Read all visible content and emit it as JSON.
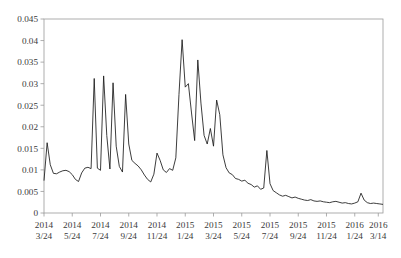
{
  "chart_data": {
    "type": "line",
    "title": "",
    "subtitle": "",
    "xlabel": "",
    "ylabel": "",
    "grid": false,
    "legend": false,
    "legend_position": "none",
    "ylim": [
      0,
      0.045
    ],
    "ytick_labels": [
      "0",
      "0.005",
      "0.01",
      "0.015",
      "0.02",
      "0.025",
      "0.03",
      "0.035",
      "0.04",
      "0.045"
    ],
    "ytick_values": [
      0,
      0.005,
      0.01,
      0.015,
      0.02,
      0.025,
      0.03,
      0.035,
      0.04,
      0.045
    ],
    "xtick_labels": [
      "2014\n3/24",
      "2014\n5/24",
      "2014\n7/24",
      "2014\n9/24",
      "2014\n11/24",
      "2015\n1/24",
      "2015\n3/24",
      "2015\n5/24",
      "2015\n7/24",
      "2015\n9/24",
      "2015\n11/24",
      "2016\n1/24",
      "2016\n3/14"
    ],
    "xtick_labels_top": [
      "2014",
      "2014",
      "2014",
      "2014",
      "2014",
      "2015",
      "2015",
      "2015",
      "2015",
      "2015",
      "2015",
      "2016",
      "2016"
    ],
    "xtick_labels_bottom": [
      "3/24",
      "5/24",
      "7/24",
      "9/24",
      "11/24",
      "1/24",
      "3/24",
      "5/24",
      "7/24",
      "9/24",
      "11/24",
      "1/24",
      "3/14"
    ],
    "xtick_positions": [
      0,
      0.0833,
      0.1667,
      0.25,
      0.3333,
      0.4167,
      0.5,
      0.5833,
      0.6667,
      0.75,
      0.8333,
      0.9167,
      0.9861
    ],
    "series": [
      {
        "name": "series-1",
        "color": "#1a1a1a",
        "values": [
          0.0075,
          0.0163,
          0.0112,
          0.0092,
          0.0091,
          0.0095,
          0.0098,
          0.0099,
          0.0096,
          0.0089,
          0.0078,
          0.0073,
          0.0093,
          0.0104,
          0.0106,
          0.0103,
          0.0312,
          0.0104,
          0.0099,
          0.0318,
          0.018,
          0.0102,
          0.0302,
          0.0155,
          0.0108,
          0.0095,
          0.0275,
          0.016,
          0.0122,
          0.0115,
          0.0109,
          0.01,
          0.0088,
          0.0078,
          0.0072,
          0.009,
          0.0139,
          0.0122,
          0.01,
          0.0094,
          0.0103,
          0.0099,
          0.0128,
          0.0275,
          0.0402,
          0.0292,
          0.03,
          0.0232,
          0.0168,
          0.0355,
          0.0255,
          0.018,
          0.016,
          0.0196,
          0.0155,
          0.0262,
          0.0228,
          0.0135,
          0.0105,
          0.0093,
          0.0089,
          0.008,
          0.0078,
          0.0074,
          0.0076,
          0.0069,
          0.0066,
          0.006,
          0.0063,
          0.0055,
          0.0058,
          0.0145,
          0.0068,
          0.0052,
          0.0047,
          0.0042,
          0.0039,
          0.0041,
          0.0038,
          0.0035,
          0.0037,
          0.0034,
          0.0032,
          0.003,
          0.0029,
          0.0031,
          0.0028,
          0.0027,
          0.0028,
          0.0026,
          0.0025,
          0.0024,
          0.0026,
          0.0027,
          0.0025,
          0.0023,
          0.0024,
          0.0022,
          0.0021,
          0.0023,
          0.0026,
          0.0046,
          0.003,
          0.0024,
          0.0022,
          0.0023,
          0.0022,
          0.0021,
          0.002
        ]
      }
    ]
  },
  "axes": {
    "plot_left": 44,
    "plot_top": 19,
    "plot_right": 383,
    "plot_bottom": 213
  }
}
